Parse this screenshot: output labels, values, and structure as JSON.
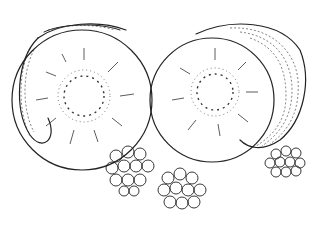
{
  "illustration": {
    "subject": "Two halved kiwis and three raspberries, black ink line drawing",
    "colors": {
      "background": "#ffffff",
      "ink": "#222222"
    },
    "items": [
      {
        "name": "kiwi-half-left",
        "cx": 80,
        "cy": 100,
        "r": 73
      },
      {
        "name": "kiwi-half-right",
        "cx": 210,
        "cy": 100,
        "r": 63
      },
      {
        "name": "raspberry-1",
        "cx": 132,
        "cy": 172
      },
      {
        "name": "raspberry-2",
        "cx": 181,
        "cy": 191
      },
      {
        "name": "raspberry-3",
        "cx": 288,
        "cy": 162
      }
    ]
  }
}
